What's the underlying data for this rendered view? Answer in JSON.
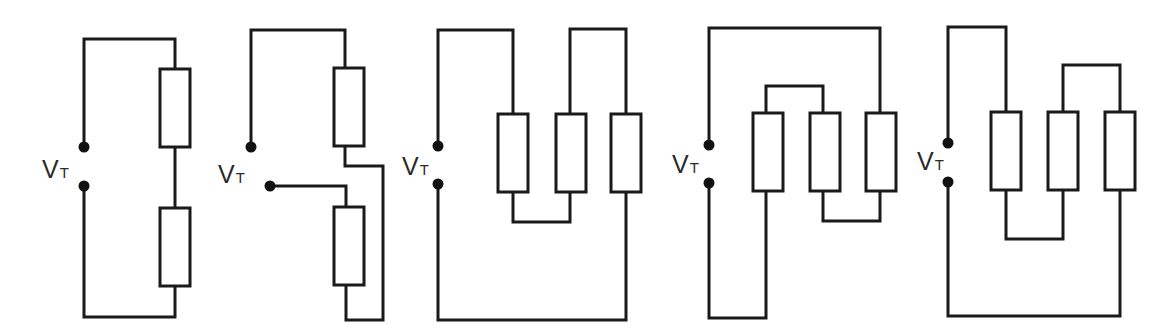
{
  "diagram": {
    "type": "circuit-schematics",
    "colors": {
      "background": "#ffffff",
      "wire": "#1a1a1a",
      "terminal": "#111111",
      "label": "#2a2a2a"
    },
    "circuits": [
      {
        "id": "circuit-1",
        "description": "Two resistors in series across V_T",
        "label": {
          "main": "V",
          "sub": "T",
          "x": 42,
          "y": 178
        },
        "terminals": [
          {
            "x": 84,
            "y": 147
          },
          {
            "x": 84,
            "y": 186
          }
        ],
        "resistors": [
          {
            "x": 160,
            "y": 69,
            "w": 30,
            "h": 78
          },
          {
            "x": 160,
            "y": 208,
            "w": 30,
            "h": 78
          }
        ],
        "wires": [
          "M84,147 L84,39 L175,39 L175,69",
          "M175,147 L175,208",
          "M175,286 L175,317 L84,317 L84,186"
        ]
      },
      {
        "id": "circuit-2",
        "description": "Two resistors; series connection with crossover return",
        "label": {
          "main": "V",
          "sub": "T",
          "x": 218,
          "y": 183
        },
        "terminals": [
          {
            "x": 251,
            "y": 147
          },
          {
            "x": 270,
            "y": 186
          }
        ],
        "resistors": [
          {
            "x": 334,
            "y": 68,
            "w": 30,
            "h": 78
          },
          {
            "x": 334,
            "y": 207,
            "w": 30,
            "h": 78
          }
        ],
        "wires": [
          "M251,147 L251,30 L345,30 L345,68",
          "M345,146 L345,166 L383,166 L383,320 L346,320 L346,285",
          "M270,186 L346,186 L346,207"
        ]
      },
      {
        "id": "circuit-3",
        "description": "Three resistors",
        "label": {
          "main": "V",
          "sub": "T",
          "x": 402,
          "y": 175
        },
        "terminals": [
          {
            "x": 438,
            "y": 146
          },
          {
            "x": 438,
            "y": 184
          }
        ],
        "resistors": [
          {
            "x": 498,
            "y": 114,
            "w": 30,
            "h": 78
          },
          {
            "x": 556,
            "y": 114,
            "w": 30,
            "h": 78
          },
          {
            "x": 611,
            "y": 114,
            "w": 30,
            "h": 78
          }
        ],
        "wires": [
          "M438,146 L438,30 L513,30 L513,114",
          "M513,192 L513,222 L570,222 L570,192",
          "M570,114 L570,29 L626,29 L626,114",
          "M626,192 L626,320 L438,320 L438,184"
        ]
      },
      {
        "id": "circuit-4",
        "description": "Three resistors",
        "label": {
          "main": "V",
          "sub": "T",
          "x": 672,
          "y": 173
        },
        "terminals": [
          {
            "x": 709,
            "y": 145
          },
          {
            "x": 709,
            "y": 183
          }
        ],
        "resistors": [
          {
            "x": 753,
            "y": 113,
            "w": 30,
            "h": 78
          },
          {
            "x": 810,
            "y": 113,
            "w": 30,
            "h": 78
          },
          {
            "x": 866,
            "y": 113,
            "w": 30,
            "h": 78
          }
        ],
        "wires": [
          "M709,145 L709,28 L880,28 L880,113",
          "M766,113 L766,86 L823,86 L823,113",
          "M823,191 L823,221 L880,221 L880,191",
          "M766,191 L766,318 L709,318 L709,183"
        ]
      },
      {
        "id": "circuit-5",
        "description": "Three resistors",
        "label": {
          "main": "V",
          "sub": "T",
          "x": 917,
          "y": 170
        },
        "terminals": [
          {
            "x": 948,
            "y": 143
          },
          {
            "x": 948,
            "y": 182
          }
        ],
        "resistors": [
          {
            "x": 991,
            "y": 112,
            "w": 30,
            "h": 78
          },
          {
            "x": 1048,
            "y": 112,
            "w": 30,
            "h": 78
          },
          {
            "x": 1105,
            "y": 112,
            "w": 30,
            "h": 78
          }
        ],
        "wires": [
          "M948,143 L948,27 L1006,27 L1006,112",
          "M1063,112 L1063,65 L1120,65 L1120,112",
          "M1006,190 L1006,239 L1063,239 L1063,190",
          "M1120,190 L1120,316 L948,316 L948,182"
        ]
      }
    ]
  }
}
